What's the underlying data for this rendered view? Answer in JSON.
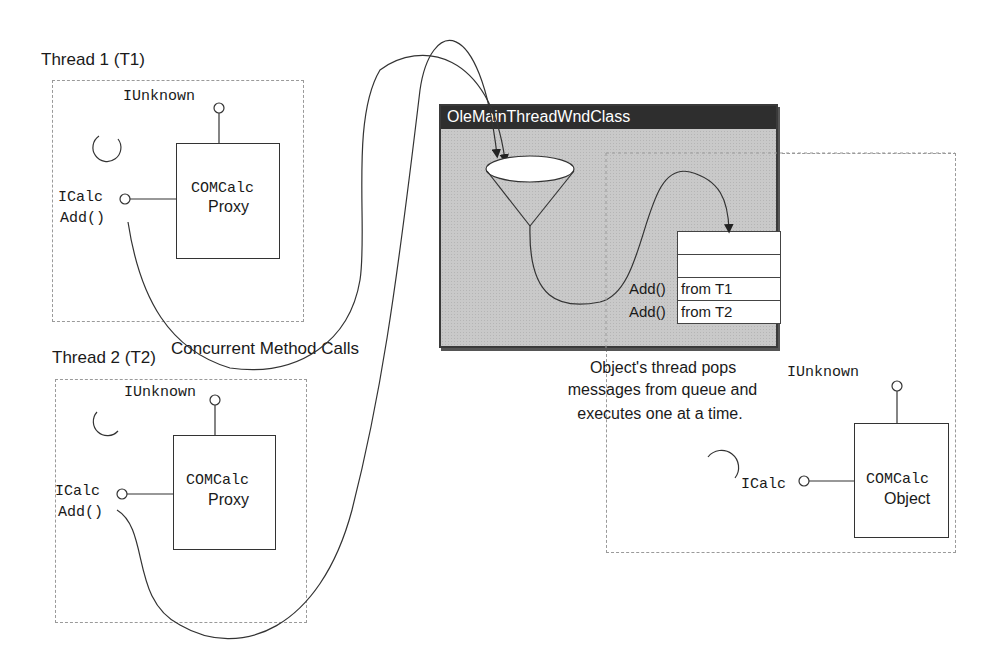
{
  "threads": [
    {
      "title": "Thread 1 (T1)",
      "iunknown_label": "IUnknown",
      "icalc_label": "ICalc",
      "method_label": "Add()",
      "component_name": "COMCalc",
      "component_type": "Proxy"
    },
    {
      "title": "Thread 2 (T2)",
      "iunknown_label": "IUnknown",
      "icalc_label": "ICalc",
      "method_label": "Add()",
      "component_name": "COMCalc",
      "component_type": "Proxy"
    }
  ],
  "concurrent_label": "Concurrent Method Calls",
  "window": {
    "title": "OleMainThreadWndClass",
    "queue": {
      "rows": [
        {
          "prefix": "",
          "text": ""
        },
        {
          "prefix": "",
          "text": ""
        },
        {
          "prefix": "Add()",
          "text": "from T1"
        },
        {
          "prefix": "Add()",
          "text": "from T2"
        }
      ]
    }
  },
  "object_caption": [
    "Object's thread pops",
    "messages from queue and",
    "executes one at a time."
  ],
  "object": {
    "iunknown_label": "IUnknown",
    "icalc_label": "ICalc",
    "component_name": "COMCalc",
    "component_type": "Object"
  }
}
